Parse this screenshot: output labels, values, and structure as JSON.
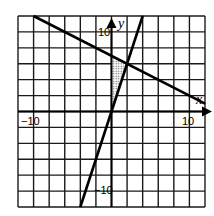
{
  "chart_data": {
    "type": "line",
    "title": "",
    "xlabel": "x",
    "ylabel": "y",
    "xlim": [
      -12,
      12
    ],
    "ylim": [
      -12,
      12
    ],
    "grid": true,
    "grid_step": 2,
    "tick_labels": {
      "x": [
        {
          "value": -10,
          "label": "−10"
        },
        {
          "value": 10,
          "label": "10"
        }
      ],
      "y": [
        {
          "value": 10,
          "label": "10"
        },
        {
          "value": -10,
          "label": "−10"
        }
      ]
    },
    "series": [
      {
        "name": "line-1",
        "equation": "y = -x/2 + 7",
        "points": [
          [
            -10,
            12
          ],
          [
            12,
            1
          ]
        ]
      },
      {
        "name": "line-2",
        "equation": "y = 3x",
        "points": [
          [
            -4,
            -12
          ],
          [
            4,
            12
          ]
        ]
      }
    ],
    "shaded_region": {
      "description": "dotted triangle bounded by y-axis, y = -x/2 + 7, and y = 3x",
      "vertices": [
        [
          0,
          0
        ],
        [
          0,
          7
        ],
        [
          2,
          6
        ]
      ]
    },
    "legend": null
  },
  "labels": {
    "x_axis": "x",
    "y_axis": "y",
    "x_neg10": "−10",
    "x_pos10": "10",
    "y_pos10": "10",
    "y_neg10": "−10"
  },
  "colors": {
    "line": "#000000",
    "grid": "#1a1a1a",
    "background": "#ffffff",
    "shade": "#999999"
  }
}
